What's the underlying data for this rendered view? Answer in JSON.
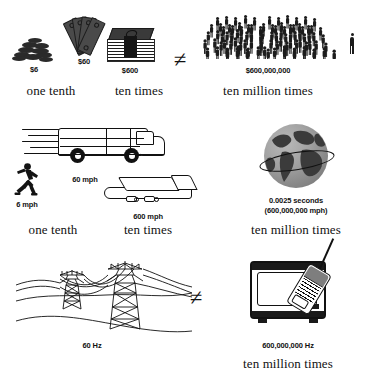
{
  "figure": {
    "type": "comparison-diagram",
    "rows": [
      {
        "id": "money",
        "domain": "money",
        "items": [
          {
            "name": "coins",
            "value": "$6",
            "caption": "one tenth",
            "icon": "coin-pile-icon"
          },
          {
            "name": "bills",
            "value": "$60",
            "caption": "",
            "icon": "bill-fan-icon"
          },
          {
            "name": "stack",
            "value": "$600",
            "caption": "ten times",
            "icon": "bill-stack-icon"
          }
        ],
        "operator": "≠",
        "right": {
          "name": "crowd",
          "value": "$600,000,000",
          "caption": "ten million times",
          "icon": "crowd-icon",
          "scale_reference": "single-person-icon"
        }
      },
      {
        "id": "speed",
        "domain": "speed",
        "items": [
          {
            "name": "runner",
            "value": "6 mph",
            "caption": "one tenth",
            "icon": "running-person-icon"
          },
          {
            "name": "van",
            "value": "60 mph",
            "caption": "",
            "icon": "van-icon"
          },
          {
            "name": "plane",
            "value": "600 mph",
            "caption": "ten times",
            "icon": "airplane-icon"
          }
        ],
        "operator": "",
        "right": {
          "name": "globe",
          "value": "0.0025 seconds",
          "value_secondary": "(600,000,000 mph)",
          "caption": "ten million times",
          "icon": "globe-icon"
        }
      },
      {
        "id": "frequency",
        "domain": "frequency",
        "items": [
          {
            "name": "power-lines",
            "value": "60 Hz",
            "caption": "",
            "icon": "power-pylon-icon"
          }
        ],
        "operator": "≠",
        "right": {
          "name": "tv-and-phone",
          "value": "600,000,000 Hz",
          "caption": "ten million times",
          "icon": "television-icon",
          "icon_secondary": "mobile-phone-icon"
        }
      }
    ]
  },
  "colors": {
    "background": "#ffffff",
    "ink": "#111111",
    "fill_dark": "#1c1c1c",
    "fill_mid": "#7e7e7e",
    "globe_land": "#3b3b3b"
  }
}
